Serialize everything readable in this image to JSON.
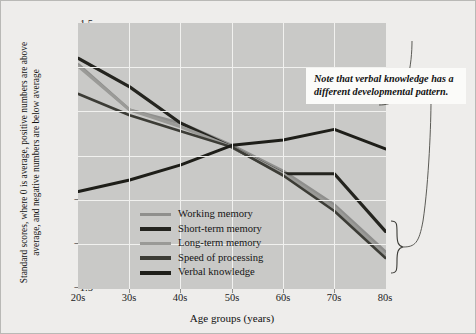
{
  "figure": {
    "background_color": "#eeedeb",
    "plot_background_color": "#c9c9c7",
    "gridline_color": "#f1f1ef"
  },
  "annotation": {
    "text": "Note that verbal knowledge has a different developmental pattern."
  },
  "axes": {
    "xlabel": "Age groups (years)",
    "ylabel": "Standard scores, where 0 is average, positive numbers are above average, and negative numbers are below average",
    "yticks": [
      "1.5",
      "1.0",
      "0.5",
      "0.0",
      "−0.5",
      "−1.0",
      "−1.5"
    ],
    "xticks": [
      "20s",
      "30s",
      "40s",
      "50s",
      "60s",
      "70s",
      "80s"
    ]
  },
  "legend": {
    "items": [
      {
        "label": "Working memory",
        "color": "#8f8f8d",
        "weight": "medium"
      },
      {
        "label": "Short-term memory",
        "color": "#24241f",
        "weight": "thick"
      },
      {
        "label": "Long-term memory",
        "color": "#9a9a97",
        "weight": "medium"
      },
      {
        "label": "Speed of processing",
        "color": "#3c3c36",
        "weight": "thick"
      },
      {
        "label": "Verbal knowledge",
        "color": "#1e1e19",
        "weight": "thick"
      }
    ]
  },
  "chart_data": {
    "type": "line",
    "title": "",
    "xlabel": "Age groups (years)",
    "ylabel": "Standard scores, where 0 is average, positive numbers are above average, and negative numbers are below average",
    "categories": [
      "20s",
      "30s",
      "40s",
      "50s",
      "60s",
      "70s",
      "80s"
    ],
    "xlim": [
      0,
      6
    ],
    "ylim": [
      -1.5,
      1.5
    ],
    "grid": true,
    "legend_position": "inside-lower-left",
    "annotations": [
      {
        "text": "Note that verbal knowledge has a different developmental pattern.",
        "style": "boxed-italic",
        "points_to": "verbal knowledge line and 80s bracket"
      },
      {
        "text": "",
        "style": "curly-brace",
        "points_to": "80s values of the four declining measures"
      }
    ],
    "series": [
      {
        "name": "Working memory",
        "color": "#8f8f8d",
        "values": [
          1.03,
          0.52,
          0.37,
          0.12,
          -0.17,
          -0.55,
          -1.08
        ]
      },
      {
        "name": "Short-term memory",
        "color": "#24241f",
        "values": [
          1.1,
          0.78,
          0.37,
          0.1,
          -0.2,
          -0.2,
          -0.85
        ]
      },
      {
        "name": "Long-term memory",
        "color": "#9a9a97",
        "values": [
          1.01,
          0.52,
          0.33,
          0.1,
          -0.2,
          -0.58,
          -1.12
        ]
      },
      {
        "name": "Speed of processing",
        "color": "#3c3c36",
        "values": [
          0.7,
          0.46,
          0.28,
          0.1,
          -0.22,
          -0.62,
          -1.15
        ]
      },
      {
        "name": "Verbal knowledge",
        "color": "#1e1e19",
        "values": [
          -0.4,
          -0.27,
          -0.1,
          0.12,
          0.18,
          0.3,
          0.08
        ]
      }
    ]
  }
}
